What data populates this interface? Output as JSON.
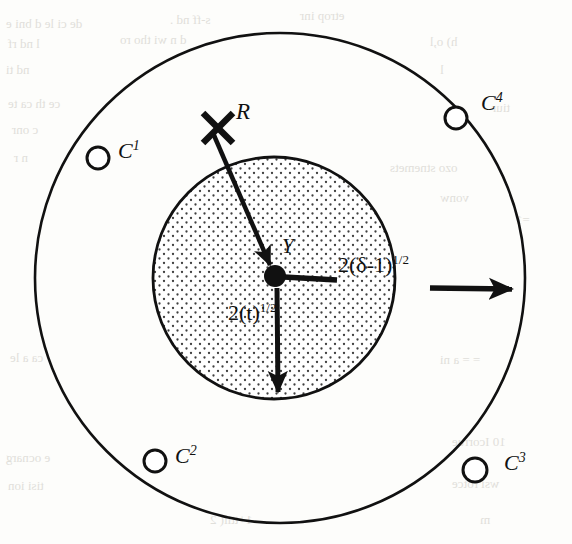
{
  "figure": {
    "name": "two-concentric-circles-diagram",
    "background_color": "#fdfdfb",
    "ink_color": "#111111",
    "stipple_color": "#4a4a4a"
  },
  "circles": {
    "outer": {
      "name": "outer-circle",
      "cx": 280,
      "cy": 278,
      "r": 245,
      "fill": "none",
      "stroke": "#111111",
      "stroke_width": 2.6
    },
    "inner": {
      "name": "inner-stippled-circle",
      "cx": 274,
      "cy": 278,
      "r": 121,
      "fill": "stipple",
      "stroke": "#111111",
      "stroke_width": 2.8
    }
  },
  "center_point": {
    "label": "Y",
    "cx": 275,
    "cy": 276,
    "r": 10
  },
  "markers": [
    {
      "id": "c1",
      "label": "C",
      "exponent": "1",
      "cx": 98,
      "cy": 158,
      "r": 11,
      "label_x": 118,
      "label_y": 144
    },
    {
      "id": "c2",
      "label": "C",
      "exponent": "2",
      "cx": 155,
      "cy": 461,
      "r": 11,
      "label_x": 175,
      "label_y": 448
    },
    {
      "id": "c3",
      "label": "C",
      "exponent": "3",
      "cx": 475,
      "cy": 470,
      "r": 12,
      "label_x": 504,
      "label_y": 454
    },
    {
      "id": "c4",
      "label": "C",
      "exponent": "4",
      "cx": 456,
      "cy": 118,
      "r": 11,
      "label_x": 480,
      "label_y": 94
    }
  ],
  "cross_mark": {
    "name": "x-mark",
    "cx": 218,
    "cy": 128,
    "arm": 17,
    "stroke_width": 6
  },
  "arrows": [
    {
      "id": "r-arrow",
      "label": "R",
      "label_x": 236,
      "label_y": 102,
      "x1": 213,
      "y1": 133,
      "x2": 272,
      "y2": 268,
      "stroke_width": 4.5
    },
    {
      "id": "delta-arrow",
      "label_text": "2(δ-1)",
      "label_sup": "1/2",
      "label_x": 338,
      "label_y": 262,
      "x1": 286,
      "y1": 277,
      "x2": 520,
      "y2": 289,
      "stroke_width": 5,
      "segments": [
        {
          "x1": 286,
          "y1": 277,
          "x2": 336,
          "y2": 279
        },
        {
          "x1": 430,
          "y1": 288,
          "x2": 520,
          "y2": 289
        }
      ]
    },
    {
      "id": "t-arrow",
      "label_text": "2(t)",
      "label_sup": "1/2",
      "label_x": 230,
      "label_y": 312,
      "x1": 277,
      "y1": 288,
      "x2": 278,
      "y2": 400,
      "stroke_width": 5
    }
  ],
  "bleed_through_text": [
    {
      "text": "de ci le  d  bni  e",
      "x": 6,
      "y": 16,
      "size": 13
    },
    {
      "text": "s-ff   nd .",
      "x": 170,
      "y": 12,
      "size": 13
    },
    {
      "text": "etrop inr",
      "x": 300,
      "y": 8,
      "size": 13
    },
    {
      "text": "l nd rf",
      "x": 8,
      "y": 36,
      "size": 13
    },
    {
      "text": "d n  wi tho  ro",
      "x": 120,
      "y": 32,
      "size": 13
    },
    {
      "text": "h)  o,l",
      "x": 430,
      "y": 34,
      "size": 13
    },
    {
      "text": "nd ti",
      "x": 6,
      "y": 62,
      "size": 13
    },
    {
      "text": "l",
      "x": 440,
      "y": 62,
      "size": 13
    },
    {
      "text": "ce th  ca  te",
      "x": 8,
      "y": 96,
      "size": 13
    },
    {
      "text": "tiur",
      "x": 492,
      "y": 100,
      "size": 13
    },
    {
      "text": "c  onr",
      "x": 12,
      "y": 122,
      "size": 13
    },
    {
      "text": "n r",
      "x": 14,
      "y": 150,
      "size": 13
    },
    {
      "text": "ozo  stnemets",
      "x": 390,
      "y": 160,
      "size": 13
    },
    {
      "text": "vonw",
      "x": 440,
      "y": 190,
      "size": 13
    },
    {
      "text": "=1",
      "x": 516,
      "y": 212,
      "size": 13
    },
    {
      "text": "ca  a le",
      "x": 10,
      "y": 350,
      "size": 13
    },
    {
      "text": "=  =  a  ni",
      "x": 440,
      "y": 352,
      "size": 13
    },
    {
      "text": "e  ocnarg",
      "x": 6,
      "y": 450,
      "size": 13
    },
    {
      "text": "10 Icorrue",
      "x": 452,
      "y": 434,
      "size": 13
    },
    {
      "text": "tisi  ion",
      "x": 8,
      "y": 478,
      "size": 13
    },
    {
      "text": "wsi rotce",
      "x": 452,
      "y": 476,
      "size": 13
    },
    {
      "text": "1+ttil( 2",
      "x": 210,
      "y": 512,
      "size": 13
    },
    {
      "text": "m",
      "x": 480,
      "y": 512,
      "size": 13
    }
  ]
}
